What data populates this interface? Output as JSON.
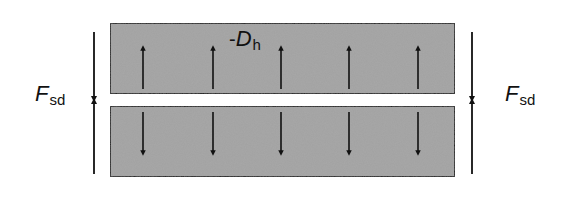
{
  "diagram": {
    "title": "",
    "colors": {
      "background": "#ffffff",
      "plate_fill": "#a3a3a3",
      "plate_stroke": "#1a1a1a",
      "arrow": "#111111"
    },
    "plates": [
      {
        "id": "top-plate",
        "x": 110,
        "y": 23,
        "width": 345,
        "height": 71
      },
      {
        "id": "bottom-plate",
        "x": 110,
        "y": 106,
        "width": 345,
        "height": 71
      }
    ],
    "internal_arrows": {
      "x_positions": [
        143,
        213,
        281,
        349,
        418
      ],
      "top_row": {
        "direction": "up",
        "y_tail": 89,
        "y_head": 48
      },
      "bottom_row": {
        "direction": "down",
        "y_tail": 112,
        "y_head": 153
      }
    },
    "force_arrows": [
      {
        "id": "left-force",
        "x": 94,
        "y_top": 32,
        "y_bottom": 174,
        "meet_y": 100
      },
      {
        "id": "right-force",
        "x": 472,
        "y_top": 32,
        "y_bottom": 174,
        "meet_y": 100
      }
    ],
    "labels": {
      "pressure": {
        "prefix": "-",
        "main": "D",
        "sub": "h"
      },
      "force_left": {
        "main": "F",
        "sub": "sd"
      },
      "force_right": {
        "main": "F",
        "sub": "sd"
      }
    }
  }
}
